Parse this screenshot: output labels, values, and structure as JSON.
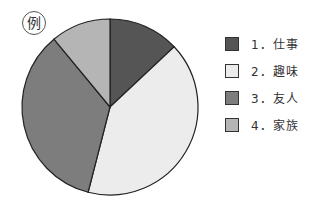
{
  "badge": "例",
  "chart_data": {
    "type": "pie",
    "title": "",
    "categories": [
      "1．仕事",
      "2．趣味",
      "3．友人",
      "4．家族"
    ],
    "values": [
      13,
      41,
      35,
      11
    ],
    "colors": [
      "#555555",
      "#ececec",
      "#7d7d7d",
      "#b5b5b5"
    ],
    "start_angle_deg": 0,
    "direction": "clockwise",
    "legend_position": "right"
  },
  "legend": [
    {
      "label": "1．仕事",
      "color": "#555555"
    },
    {
      "label": "2．趣味",
      "color": "#ececec"
    },
    {
      "label": "3．友人",
      "color": "#7d7d7d"
    },
    {
      "label": "4．家族",
      "color": "#b5b5b5"
    }
  ]
}
